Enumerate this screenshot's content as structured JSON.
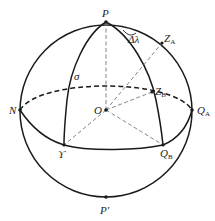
{
  "diagram": {
    "colors": {
      "stroke": "#1a1a1a",
      "dash": "#777777",
      "background": "#ffffff"
    },
    "points": {
      "P": "P",
      "P_prime": "P′",
      "N": "N",
      "O": "O",
      "Q_A": {
        "base": "Q",
        "sub": "A"
      },
      "Q_B": {
        "base": "Q",
        "sub": "B"
      },
      "Z_A": {
        "base": "Z",
        "sub": "A"
      },
      "Z_B": {
        "base": "Z",
        "sub": "B"
      },
      "vernal": "ϒ",
      "sigma": "σ",
      "delta_lambda": "Δλ"
    }
  }
}
